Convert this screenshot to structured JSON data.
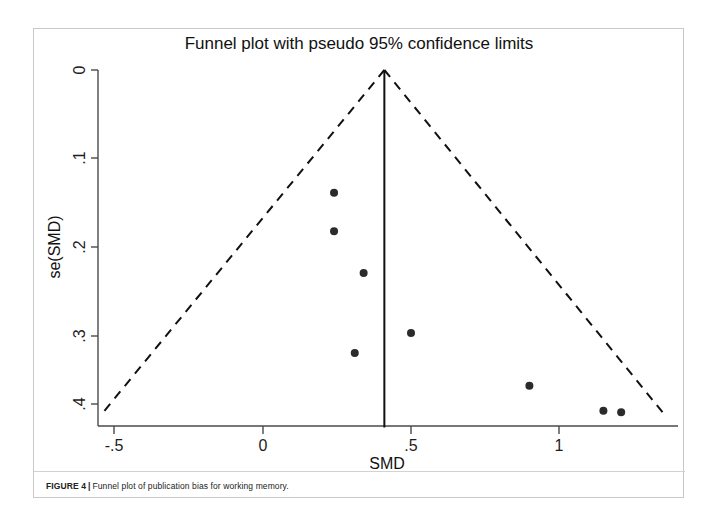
{
  "figure": {
    "caption_label": "FIGURE 4",
    "caption_separator": "|",
    "caption_text": "Funnel plot of publication bias for working memory."
  },
  "chart_data": {
    "type": "scatter",
    "title": "Funnel plot with pseudo 95% confidence limits",
    "xlabel": "SMD",
    "ylabel": "se(SMD)",
    "xlim": [
      -0.62,
      1.3
    ],
    "ylim": [
      0.0,
      0.428
    ],
    "y_axis_inverted": true,
    "grid": false,
    "legend": null,
    "xticks": [
      -0.5,
      0,
      0.5,
      1
    ],
    "xticklabels": [
      "-.5",
      "0",
      ".5",
      "1"
    ],
    "yticks": [
      0,
      0.1,
      0.2,
      0.3,
      0.4
    ],
    "yticklabels": [
      "0",
      ".1",
      ".2",
      ".3",
      ".4"
    ],
    "pooled_effect": 0.41,
    "pooled_line_label": "pooled effect vertical reference line",
    "pseudo_ci_limits": {
      "label": "pseudo 95% confidence limits",
      "style": "dashed",
      "apex": [
        0.41,
        0.0
      ],
      "left_endpoint": [
        -0.54,
        0.41
      ],
      "right_endpoint": [
        1.35,
        0.41
      ]
    },
    "points": [
      {
        "x": 0.24,
        "y": 0.147
      },
      {
        "x": 0.24,
        "y": 0.193
      },
      {
        "x": 0.34,
        "y": 0.243
      },
      {
        "x": 0.5,
        "y": 0.315
      },
      {
        "x": 0.31,
        "y": 0.339
      },
      {
        "x": 0.9,
        "y": 0.378
      },
      {
        "x": 1.15,
        "y": 0.408
      },
      {
        "x": 1.21,
        "y": 0.41
      }
    ],
    "marker": {
      "shape": "circle",
      "size": 8,
      "color": "#2b2b2b"
    },
    "colors": {
      "axis": "#4a4a4a",
      "line": "#111111",
      "dashed": "#111111",
      "marker": "#2b2b2b"
    }
  }
}
